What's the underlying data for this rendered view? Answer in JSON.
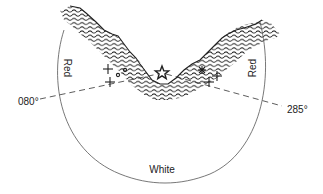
{
  "diagram": {
    "type": "sector-light",
    "colors": {
      "ink": "#222222",
      "arc": "#555555",
      "background": "#ffffff"
    },
    "light_symbol": "star-icon",
    "sectors": [
      {
        "name": "left",
        "label": "Red"
      },
      {
        "name": "right",
        "label": "Red"
      },
      {
        "name": "bottom",
        "label": "White"
      }
    ],
    "bearings": [
      {
        "side": "left",
        "label": "080°"
      },
      {
        "side": "right",
        "label": "285°"
      }
    ],
    "hazards": {
      "left_crosses": 2,
      "left_circles": 2,
      "right_crosses": 2,
      "right_asterisk": 1
    }
  }
}
